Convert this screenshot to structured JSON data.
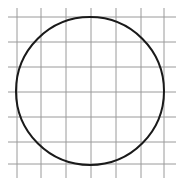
{
  "diagram": {
    "type": "circle-on-grid",
    "grid": {
      "vertical_lines_x": [
        17,
        41,
        66,
        91,
        116,
        141,
        164
      ],
      "horizontal_lines_y": [
        17,
        42,
        67,
        92,
        117,
        142,
        164
      ],
      "extent": {
        "x0": 8,
        "x1": 176,
        "y0": 8,
        "y1": 178
      },
      "color": "#9a9a9a"
    },
    "circle": {
      "cx": 90,
      "cy": 91,
      "r": 74,
      "stroke": "#1a1a1a",
      "stroke_width": 2
    }
  }
}
